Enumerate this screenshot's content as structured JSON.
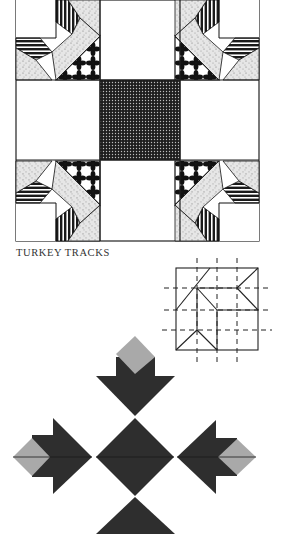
{
  "caption": "TURKEY TRACKS",
  "colors": {
    "ink": "#1a1a1a",
    "dark_fabric": "#2e2e2e",
    "light_fabric": "#a8a8a8",
    "paper": "#ffffff",
    "speckle": "#d8d8d8"
  },
  "figures": {
    "quilt_block": "Turkey Tracks quilt block with patterned corners and dotted center square",
    "construction_diagram": "Folding grid diagram with dashed fold lines",
    "folded_model": "Folded paper rendition of the Turkey Tracks motif"
  }
}
